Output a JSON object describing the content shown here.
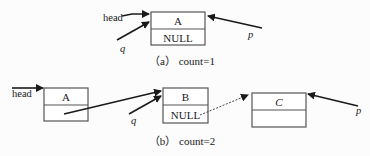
{
  "diagram": {
    "type": "linked-list-insertion",
    "part_a": {
      "caption": "（a）  count=1",
      "pointers": {
        "head": "head",
        "q": "q",
        "p": "p"
      },
      "nodes": [
        {
          "data": "A",
          "next": "NULL"
        }
      ]
    },
    "part_b": {
      "caption": "（b）  count=2",
      "pointers": {
        "head": "head",
        "q": "q",
        "p": "p"
      },
      "nodes": [
        {
          "data": "A",
          "next": ""
        },
        {
          "data": "B",
          "next": "NULL"
        },
        {
          "data": "C",
          "next": ""
        }
      ],
      "links": [
        {
          "from": "A",
          "to": "B",
          "style": "solid"
        },
        {
          "from": "B",
          "to": "C",
          "style": "dotted"
        }
      ]
    },
    "colors": {
      "line": "#1a1a1a",
      "box_stroke": "#555555",
      "background": "#fcfcfc"
    }
  }
}
